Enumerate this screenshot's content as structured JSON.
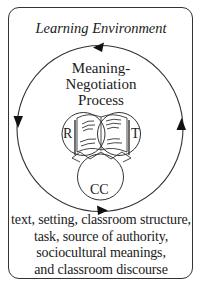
{
  "diagram": {
    "title": "Learning Environment",
    "process_label": {
      "lines": [
        "Meaning-",
        "Negotiation",
        "Process"
      ]
    },
    "venn": {
      "circles": [
        {
          "id": "R",
          "label": "R"
        },
        {
          "id": "T",
          "label": "T"
        },
        {
          "id": "CC",
          "label": "CC"
        }
      ],
      "center_icon": "open-book-icon"
    },
    "cycle": {
      "direction": "counter-clockwise",
      "arrows": [
        "top-left",
        "left-down",
        "bottom-right",
        "right-up"
      ]
    },
    "environment_factors": {
      "lines": [
        "text, setting, classroom structure,",
        "task, source of authority,",
        "sociocultural meanings,",
        "and classroom discourse"
      ]
    },
    "colors": {
      "stroke": "#333333",
      "text": "#1a1a1a",
      "background": "#ffffff"
    }
  }
}
